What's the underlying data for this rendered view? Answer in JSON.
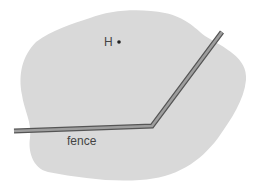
{
  "diagram": {
    "region": {
      "name": "field-region",
      "fill": "#d9d9d9"
    },
    "point": {
      "label": "H",
      "color": "#222222"
    },
    "fence": {
      "label": "fence",
      "fill": "#9a9a9a",
      "stroke": "#555555"
    }
  }
}
